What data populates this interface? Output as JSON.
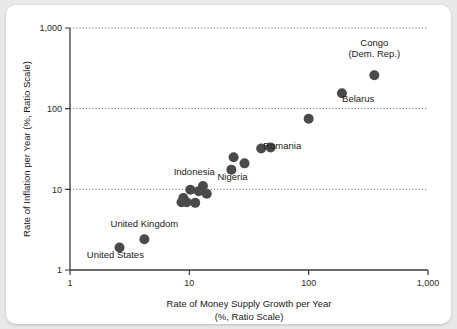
{
  "chart_data": {
    "type": "scatter",
    "title": "",
    "xlabel": "Rate of Money Supply Growth per Year",
    "xlabel_line2": "(%, Ratio Scale)",
    "ylabel": "Rate of Inflation per Year (%, Ratio Scale)",
    "xscale": "log",
    "yscale": "log",
    "xlim": [
      1,
      1000
    ],
    "ylim": [
      1,
      1000
    ],
    "xticks": [
      1,
      10,
      100,
      1000
    ],
    "xticklabels": [
      "1",
      "10",
      "100",
      "1,000"
    ],
    "yticks": [
      1,
      10,
      100,
      1000
    ],
    "yticklabels": [
      "1",
      "10",
      "100",
      "1,000"
    ],
    "grid": "horizontal-dotted",
    "gridlines_y": [
      10,
      100,
      1000
    ],
    "legend": "none",
    "marker_color": "#4a4a4a",
    "marker_size": 5,
    "points": [
      {
        "x": 2.6,
        "y": 1.9,
        "label": "United States",
        "label_pos": "below-left"
      },
      {
        "x": 4.2,
        "y": 2.4,
        "label": "United Kingdom",
        "label_pos": "above"
      },
      {
        "x": 8.6,
        "y": 6.9,
        "label": "",
        "label_pos": ""
      },
      {
        "x": 8.9,
        "y": 7.8,
        "label": "",
        "label_pos": ""
      },
      {
        "x": 9.5,
        "y": 6.9,
        "label": "",
        "label_pos": ""
      },
      {
        "x": 10.2,
        "y": 9.9,
        "label": "",
        "label_pos": ""
      },
      {
        "x": 11.2,
        "y": 6.8,
        "label": "",
        "label_pos": ""
      },
      {
        "x": 12.0,
        "y": 9.5,
        "label": "",
        "label_pos": ""
      },
      {
        "x": 13.0,
        "y": 11.0,
        "label": "Indonesia",
        "label_pos": "above-left"
      },
      {
        "x": 14.0,
        "y": 8.8,
        "label": "",
        "label_pos": ""
      },
      {
        "x": 22.5,
        "y": 17.5,
        "label": "",
        "label_pos": ""
      },
      {
        "x": 23.5,
        "y": 25.0,
        "label": "Nigeria",
        "label_pos": "below"
      },
      {
        "x": 29.0,
        "y": 21.0,
        "label": "",
        "label_pos": ""
      },
      {
        "x": 40.0,
        "y": 32.0,
        "label": "",
        "label_pos": ""
      },
      {
        "x": 48.0,
        "y": 33.0,
        "label": "Romania",
        "label_pos": "right"
      },
      {
        "x": 100.0,
        "y": 75.0,
        "label": "",
        "label_pos": ""
      },
      {
        "x": 190.0,
        "y": 155.0,
        "label": "Belarus",
        "label_pos": "right-below"
      },
      {
        "x": 355.0,
        "y": 260.0,
        "label": "Congo (Dem. Rep.)",
        "label_pos": "above"
      }
    ],
    "annotations": [
      {
        "text": "Congo",
        "x": 355,
        "y": 600
      },
      {
        "text": "(Dem. Rep.)",
        "x": 355,
        "y": 440
      },
      {
        "text": "Belarus",
        "x": 260,
        "y": 120
      },
      {
        "text": "Romania",
        "x": 60,
        "y": 32
      },
      {
        "text": "Nigeria",
        "x": 23,
        "y": 13
      },
      {
        "text": "Indonesia",
        "x": 11,
        "y": 15
      },
      {
        "text": "United Kingdom",
        "x": 4.2,
        "y": 3.4
      },
      {
        "text": "United States",
        "x": 2.4,
        "y": 1.4
      }
    ]
  }
}
